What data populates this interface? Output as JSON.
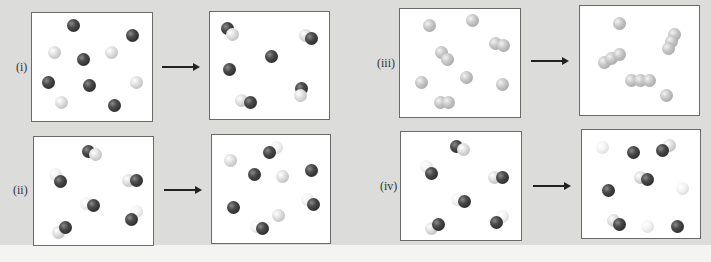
{
  "figure": {
    "rows": [
      {
        "label": "(i)",
        "before_panel": {
          "x": 31,
          "y": 12,
          "w": 122,
          "h": 110
        },
        "after_panel": {
          "x": 209,
          "y": 11,
          "w": 121,
          "h": 109
        },
        "arrow": {
          "x": 162,
          "y": 66,
          "w": 36
        },
        "label_pos": {
          "x": 16,
          "y": 60
        },
        "before_atoms": [
          {
            "c": "dark",
            "x": 67,
            "y": 19
          },
          {
            "c": "dark",
            "x": 126,
            "y": 29
          },
          {
            "c": "light",
            "x": 48,
            "y": 46
          },
          {
            "c": "dark",
            "x": 77,
            "y": 53
          },
          {
            "c": "light",
            "x": 105,
            "y": 46
          },
          {
            "c": "dark",
            "x": 42,
            "y": 76
          },
          {
            "c": "dark",
            "x": 83,
            "y": 79
          },
          {
            "c": "light",
            "x": 130,
            "y": 76
          },
          {
            "c": "light",
            "x": 55,
            "y": 96
          },
          {
            "c": "dark",
            "x": 108,
            "y": 99
          }
        ],
        "after_atoms": [
          {
            "c": "dark",
            "x": 221,
            "y": 22
          },
          {
            "c": "light",
            "x": 226,
            "y": 28
          },
          {
            "c": "light",
            "x": 299,
            "y": 29
          },
          {
            "c": "dark",
            "x": 305,
            "y": 32
          },
          {
            "c": "dark",
            "x": 265,
            "y": 50
          },
          {
            "c": "dark",
            "x": 223,
            "y": 63
          },
          {
            "c": "dark",
            "x": 295,
            "y": 82
          },
          {
            "c": "light",
            "x": 294,
            "y": 89
          },
          {
            "c": "light",
            "x": 235,
            "y": 94
          },
          {
            "c": "dark",
            "x": 244,
            "y": 96
          }
        ]
      },
      {
        "label": "(ii)",
        "before_panel": {
          "x": 33,
          "y": 136,
          "w": 121,
          "h": 110
        },
        "after_panel": {
          "x": 211,
          "y": 134,
          "w": 120,
          "h": 110
        },
        "arrow": {
          "x": 164,
          "y": 189,
          "w": 36
        },
        "label_pos": {
          "x": 13,
          "y": 183
        },
        "before_atoms": [
          {
            "c": "dark",
            "x": 82,
            "y": 145
          },
          {
            "c": "light",
            "x": 89,
            "y": 148
          },
          {
            "c": "white",
            "x": 49,
            "y": 168
          },
          {
            "c": "dark",
            "x": 54,
            "y": 175
          },
          {
            "c": "light",
            "x": 122,
            "y": 174
          },
          {
            "c": "dark",
            "x": 130,
            "y": 174
          },
          {
            "c": "white",
            "x": 80,
            "y": 197
          },
          {
            "c": "dark",
            "x": 87,
            "y": 199
          },
          {
            "c": "white",
            "x": 130,
            "y": 205
          },
          {
            "c": "dark",
            "x": 125,
            "y": 213
          },
          {
            "c": "light",
            "x": 52,
            "y": 226
          },
          {
            "c": "dark",
            "x": 59,
            "y": 221
          }
        ],
        "after_atoms": [
          {
            "c": "white",
            "x": 270,
            "y": 141
          },
          {
            "c": "dark",
            "x": 263,
            "y": 146
          },
          {
            "c": "light",
            "x": 224,
            "y": 154
          },
          {
            "c": "dark",
            "x": 248,
            "y": 168
          },
          {
            "c": "light",
            "x": 276,
            "y": 170
          },
          {
            "c": "dark",
            "x": 305,
            "y": 164
          },
          {
            "c": "white",
            "x": 301,
            "y": 193
          },
          {
            "c": "dark",
            "x": 307,
            "y": 198
          },
          {
            "c": "dark",
            "x": 227,
            "y": 201
          },
          {
            "c": "light",
            "x": 272,
            "y": 209
          },
          {
            "c": "white",
            "x": 250,
            "y": 220
          },
          {
            "c": "dark",
            "x": 256,
            "y": 222
          }
        ]
      },
      {
        "label": "(iii)",
        "before_panel": {
          "x": 399,
          "y": 8,
          "w": 122,
          "h": 110
        },
        "after_panel": {
          "x": 579,
          "y": 5,
          "w": 121,
          "h": 111
        },
        "arrow": {
          "x": 531,
          "y": 60,
          "w": 36
        },
        "label_pos": {
          "x": 377,
          "y": 56
        },
        "before_atoms": [
          {
            "c": "grey",
            "x": 423,
            "y": 19
          },
          {
            "c": "grey",
            "x": 466,
            "y": 14
          },
          {
            "c": "grey",
            "x": 489,
            "y": 37
          },
          {
            "c": "grey",
            "x": 497,
            "y": 39
          },
          {
            "c": "grey",
            "x": 435,
            "y": 46
          },
          {
            "c": "grey",
            "x": 441,
            "y": 53
          },
          {
            "c": "grey",
            "x": 415,
            "y": 76
          },
          {
            "c": "grey",
            "x": 460,
            "y": 71
          },
          {
            "c": "grey",
            "x": 496,
            "y": 78
          },
          {
            "c": "grey",
            "x": 434,
            "y": 96
          },
          {
            "c": "grey",
            "x": 442,
            "y": 96
          }
        ],
        "after_atoms": [
          {
            "c": "grey",
            "x": 613,
            "y": 17
          },
          {
            "c": "grey",
            "x": 668,
            "y": 28
          },
          {
            "c": "grey",
            "x": 665,
            "y": 35
          },
          {
            "c": "grey",
            "x": 662,
            "y": 42
          },
          {
            "c": "grey",
            "x": 598,
            "y": 56
          },
          {
            "c": "grey",
            "x": 605,
            "y": 52
          },
          {
            "c": "grey",
            "x": 613,
            "y": 48
          },
          {
            "c": "grey",
            "x": 625,
            "y": 74
          },
          {
            "c": "grey",
            "x": 634,
            "y": 74
          },
          {
            "c": "grey",
            "x": 643,
            "y": 74
          },
          {
            "c": "grey",
            "x": 660,
            "y": 89
          }
        ]
      },
      {
        "label": "(iv)",
        "before_panel": {
          "x": 400,
          "y": 131,
          "w": 122,
          "h": 110
        },
        "after_panel": {
          "x": 581,
          "y": 129,
          "w": 120,
          "h": 110
        },
        "arrow": {
          "x": 533,
          "y": 185,
          "w": 36
        },
        "label_pos": {
          "x": 380,
          "y": 179
        },
        "before_atoms": [
          {
            "c": "dark",
            "x": 450,
            "y": 140
          },
          {
            "c": "light",
            "x": 457,
            "y": 143
          },
          {
            "c": "white",
            "x": 420,
            "y": 160
          },
          {
            "c": "dark",
            "x": 425,
            "y": 167
          },
          {
            "c": "light",
            "x": 488,
            "y": 171
          },
          {
            "c": "dark",
            "x": 496,
            "y": 171
          },
          {
            "c": "white",
            "x": 451,
            "y": 193
          },
          {
            "c": "dark",
            "x": 458,
            "y": 195
          },
          {
            "c": "white",
            "x": 496,
            "y": 210
          },
          {
            "c": "dark",
            "x": 490,
            "y": 216
          },
          {
            "c": "light",
            "x": 425,
            "y": 222
          },
          {
            "c": "dark",
            "x": 432,
            "y": 218
          }
        ],
        "after_atoms": [
          {
            "c": "white",
            "x": 596,
            "y": 141
          },
          {
            "c": "dark",
            "x": 627,
            "y": 146
          },
          {
            "c": "light",
            "x": 663,
            "y": 139
          },
          {
            "c": "dark",
            "x": 656,
            "y": 144
          },
          {
            "c": "light",
            "x": 634,
            "y": 171
          },
          {
            "c": "dark",
            "x": 641,
            "y": 173
          },
          {
            "c": "dark",
            "x": 602,
            "y": 184
          },
          {
            "c": "white",
            "x": 676,
            "y": 182
          },
          {
            "c": "light",
            "x": 607,
            "y": 214
          },
          {
            "c": "dark",
            "x": 613,
            "y": 218
          },
          {
            "c": "white",
            "x": 641,
            "y": 220
          },
          {
            "c": "dark",
            "x": 671,
            "y": 220
          }
        ]
      }
    ]
  }
}
